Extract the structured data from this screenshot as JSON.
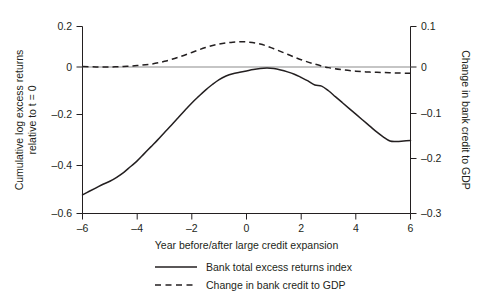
{
  "chart_data": {
    "type": "line",
    "title": "",
    "subtitle": "",
    "xlabel": "Year before/after large credit expansion",
    "ylabel": "Cumulative log excess returns relative to t = 0",
    "ylabel_line1": "Cumulative log excess returns",
    "ylabel_line2": "relative to t = 0",
    "y2label": "Change in bank credit to GDP",
    "xlim": [
      -6,
      6
    ],
    "ylim": [
      -0.6,
      0.2
    ],
    "y2lim": [
      -0.3,
      0.1
    ],
    "grid": false,
    "legend_position": "bottom",
    "xticks": [
      -6,
      -4,
      -2,
      0,
      2,
      4,
      6
    ],
    "xticklabels": [
      "–6",
      "–4",
      "–2",
      "0",
      "2",
      "4",
      "6"
    ],
    "yticks": [
      0.2,
      0,
      -0.2,
      -0.4,
      -0.6
    ],
    "yticklabels": [
      "0.2",
      "0",
      "–0.2",
      "–0.4",
      "–0.6"
    ],
    "y2ticks": [
      0.1,
      0,
      -0.1,
      -0.2,
      -0.3
    ],
    "y2ticklabels": [
      "0.1",
      "0",
      "–0.1",
      "–0.2",
      "–0.3"
    ],
    "zero_reference_line": 0,
    "series": [
      {
        "name": "Bank total excess returns index",
        "style": "solid",
        "axis": "left",
        "color": "#231f20",
        "x": [
          -6.0,
          -5.75,
          -5.5,
          -5.25,
          -5.0,
          -4.75,
          -4.5,
          -4.25,
          -4.0,
          -3.75,
          -3.5,
          -3.25,
          -3.0,
          -2.75,
          -2.5,
          -2.25,
          -2.0,
          -1.75,
          -1.5,
          -1.25,
          -1.0,
          -0.75,
          -0.5,
          -0.25,
          0.0,
          0.25,
          0.5,
          0.75,
          1.0,
          1.25,
          1.5,
          1.75,
          2.0,
          2.25,
          2.5,
          2.75,
          3.0,
          3.25,
          3.5,
          3.75,
          4.0,
          4.25,
          4.5,
          4.75,
          5.0,
          5.25,
          5.5,
          5.75,
          6.0
        ],
        "y": [
          -0.52,
          -0.505,
          -0.49,
          -0.475,
          -0.462,
          -0.445,
          -0.425,
          -0.4,
          -0.375,
          -0.345,
          -0.315,
          -0.285,
          -0.253,
          -0.222,
          -0.19,
          -0.158,
          -0.127,
          -0.099,
          -0.072,
          -0.048,
          -0.027,
          -0.012,
          -0.002,
          0.004,
          0.01,
          0.016,
          0.02,
          0.022,
          0.02,
          0.014,
          0.006,
          -0.004,
          -0.018,
          -0.033,
          -0.05,
          -0.055,
          -0.075,
          -0.1,
          -0.125,
          -0.15,
          -0.175,
          -0.2,
          -0.225,
          -0.25,
          -0.272,
          -0.29,
          -0.292,
          -0.29,
          -0.288
        ]
      },
      {
        "name": "Change in bank credit to GDP",
        "style": "dashed",
        "axis": "right",
        "color": "#231f20",
        "x": [
          -6.0,
          -5.5,
          -5.0,
          -4.5,
          -4.0,
          -3.5,
          -3.0,
          -2.5,
          -2.0,
          -1.5,
          -1.0,
          -0.5,
          0.0,
          0.5,
          1.0,
          1.5,
          2.0,
          2.5,
          3.0,
          3.5,
          4.0,
          4.5,
          5.0,
          5.5,
          6.0
        ],
        "y": [
          0.0145,
          0.0135,
          0.0135,
          0.0145,
          0.0165,
          0.0195,
          0.0255,
          0.034,
          0.0445,
          0.055,
          0.0625,
          0.0665,
          0.067,
          0.0625,
          0.0525,
          0.0405,
          0.029,
          0.0195,
          0.012,
          0.0075,
          0.0045,
          0.0025,
          0.0015,
          0.0005,
          0.0
        ]
      }
    ],
    "legend": [
      {
        "label": "Bank total excess returns index",
        "style": "solid"
      },
      {
        "label": "Change in bank credit to GDP",
        "style": "dashed"
      }
    ],
    "colors": {
      "foreground": "#231f20",
      "zero_line": "#8c8c8c",
      "background": "#ffffff"
    }
  }
}
